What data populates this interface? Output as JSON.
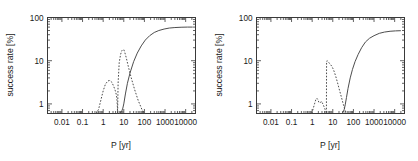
{
  "figure": {
    "background_color": "#ffffff",
    "curve_color": "#4d4d4d",
    "axis_color": "#3a3a3a",
    "panel_count": 2
  },
  "chart_data": [
    {
      "type": "line",
      "panel": "left",
      "title": "",
      "xlabel": "P [yr]",
      "ylabel": "success rate [%]",
      "xscale": "log",
      "yscale": "log",
      "xlim": [
        0.002,
        30000
      ],
      "ylim": [
        0.6,
        100
      ],
      "grid": false,
      "legend": null,
      "xticks": [
        0.01,
        0.1,
        1,
        10,
        100,
        1000,
        10000
      ],
      "xticklabels": [
        "0.01",
        "0.1",
        "1",
        "10",
        "100",
        "1000",
        "10000"
      ],
      "yticks": [
        1,
        10,
        100
      ],
      "yticklabels": [
        "1",
        "10",
        "100"
      ],
      "series": [
        {
          "name": "solid-curve",
          "style": "solid",
          "x": [
            6.0,
            7.0,
            8.0,
            9.0,
            10.0,
            12.0,
            15.0,
            20.0,
            30.0,
            45.0,
            70.0,
            110.0,
            180.0,
            300.0,
            500.0,
            900.0,
            1600.0,
            3000.0,
            6000.0,
            12000.0,
            22000.0
          ],
          "y": [
            0.6,
            0.62,
            0.68,
            0.8,
            1.0,
            1.7,
            3.0,
            5.2,
            9.5,
            15.0,
            22.0,
            30.0,
            38.0,
            45.0,
            50.0,
            54.0,
            57.0,
            58.5,
            59.5,
            60.0,
            60.0
          ]
        },
        {
          "name": "dashed-curve",
          "style": "dashed",
          "x": [
            0.45,
            0.6,
            0.8,
            1.0,
            1.3,
            1.7,
            2.1,
            2.6,
            3.2,
            3.9,
            4.4,
            4.7,
            4.9,
            5.0,
            5.3,
            6.0,
            7.0,
            8.0,
            9.0,
            9.8,
            10.0,
            11.0,
            13.0,
            17.0,
            23.0,
            33.0,
            50.0,
            75.0,
            95.0,
            110.0
          ],
          "y": [
            0.6,
            0.75,
            1.3,
            2.0,
            2.9,
            3.4,
            3.5,
            3.2,
            2.6,
            2.0,
            1.6,
            1.2,
            0.85,
            0.6,
            3.0,
            9.0,
            14.0,
            17.0,
            18.0,
            18.2,
            18.0,
            16.0,
            12.0,
            7.0,
            4.0,
            2.2,
            1.2,
            0.75,
            0.62,
            0.6
          ]
        }
      ]
    },
    {
      "type": "line",
      "panel": "right",
      "title": "",
      "xlabel": "P [yr]",
      "ylabel": "success rate [%]",
      "xscale": "log",
      "yscale": "log",
      "xlim": [
        0.002,
        30000
      ],
      "ylim": [
        0.6,
        100
      ],
      "grid": false,
      "legend": null,
      "xticks": [
        0.01,
        0.1,
        1,
        10,
        100,
        1000,
        10000
      ],
      "xticklabels": [
        "0.01",
        "0.1",
        "1",
        "10",
        "100",
        "1000",
        "10000"
      ],
      "yticks": [
        1,
        10,
        100
      ],
      "yticklabels": [
        "1",
        "10",
        "100"
      ],
      "series": [
        {
          "name": "solid-curve",
          "style": "solid",
          "x": [
            28.0,
            32.0,
            36.0,
            40.0,
            46.0,
            55.0,
            70.0,
            90.0,
            120.0,
            170.0,
            250.0,
            380.0,
            600.0,
            1000.0,
            1800.0,
            3200.0,
            6000.0,
            11000.0,
            20000.0
          ],
          "y": [
            0.6,
            0.65,
            0.75,
            0.95,
            1.4,
            2.3,
            4.0,
            6.3,
            9.5,
            14.0,
            20.0,
            27.0,
            33.0,
            38.0,
            43.0,
            46.0,
            48.0,
            49.0,
            49.5
          ]
        },
        {
          "name": "dashed-curve",
          "style": "dashed",
          "x": [
            0.95,
            1.1,
            1.3,
            1.5,
            1.7,
            1.9,
            2.1,
            2.4,
            2.8,
            3.3,
            3.8,
            4.2,
            4.5,
            4.7,
            4.9,
            5.0,
            5.3,
            5.7,
            6.2,
            7.0,
            8.0,
            9.0,
            10.5,
            12.0,
            14.0,
            17.0,
            21.0,
            26.0,
            32.0,
            38.0,
            42.0,
            45.0
          ],
          "y": [
            0.6,
            0.75,
            1.0,
            1.25,
            1.35,
            1.25,
            1.1,
            1.05,
            1.15,
            1.0,
            0.85,
            0.75,
            0.68,
            0.63,
            0.6,
            9.8,
            10.0,
            9.8,
            9.3,
            8.6,
            8.0,
            7.4,
            6.4,
            5.4,
            4.3,
            3.1,
            2.1,
            1.45,
            1.0,
            0.75,
            0.65,
            0.6
          ]
        }
      ]
    }
  ]
}
